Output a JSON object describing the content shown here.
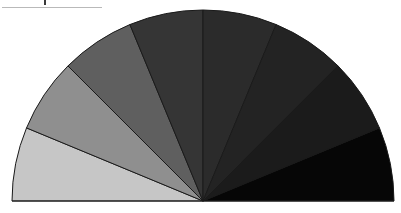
{
  "chart_data": {
    "type": "pie",
    "variant": "semicircle",
    "title": "",
    "legend": [],
    "labels_visible": false,
    "start_angle_deg": 180,
    "end_angle_deg": 0,
    "slices": [
      {
        "index": 1,
        "value": 12.5,
        "angle_deg": 22.5,
        "color": "#c6c6c6"
      },
      {
        "index": 2,
        "value": 12.5,
        "angle_deg": 22.5,
        "color": "#8f8f8f"
      },
      {
        "index": 3,
        "value": 12.5,
        "angle_deg": 22.5,
        "color": "#5f5f5f"
      },
      {
        "index": 4,
        "value": 12.5,
        "angle_deg": 22.5,
        "color": "#353535"
      },
      {
        "index": 5,
        "value": 12.5,
        "angle_deg": 22.5,
        "color": "#2b2b2b"
      },
      {
        "index": 6,
        "value": 12.5,
        "angle_deg": 22.5,
        "color": "#232323"
      },
      {
        "index": 7,
        "value": 12.5,
        "angle_deg": 22.5,
        "color": "#1b1b1b"
      },
      {
        "index": 8,
        "value": 12.5,
        "angle_deg": 22.5,
        "color": "#060606"
      }
    ],
    "geometry": {
      "cx": 203,
      "cy": 201,
      "r": 191
    },
    "stroke_color": "#1a1a1a"
  }
}
